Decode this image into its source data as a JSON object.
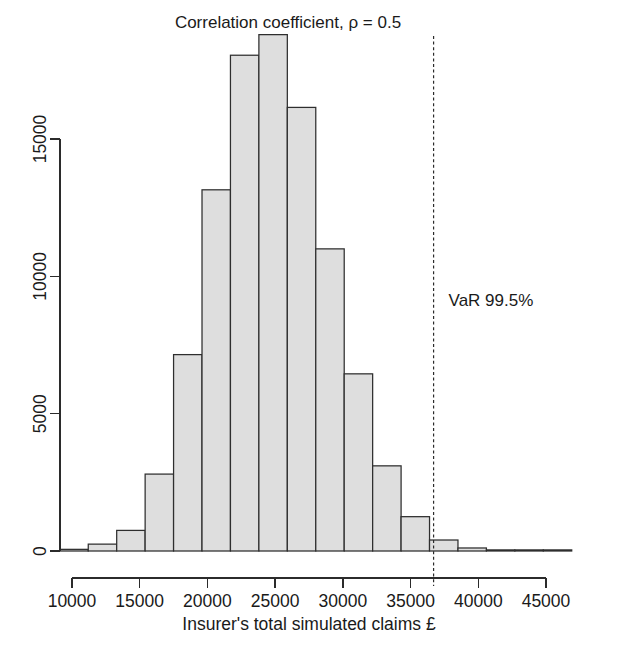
{
  "chart_data": {
    "type": "bar",
    "subtype": "histogram",
    "title": "Correlation coefficient, ρ = 0.5",
    "xlabel": "Insurer's total simulated claims £",
    "ylabel": "",
    "xlim": [
      9000,
      46500
    ],
    "ylim": [
      0,
      19500
    ],
    "xticks": [
      10000,
      15000,
      20000,
      25000,
      30000,
      35000,
      40000,
      45000
    ],
    "xticklabels": [
      "10000",
      "15000",
      "20000",
      "25000",
      "30000",
      "35000",
      "40000",
      "45000"
    ],
    "yticks": [
      0,
      5000,
      10000,
      15000
    ],
    "yticklabels": [
      "0",
      "5000",
      "10000",
      "15000"
    ],
    "grid": false,
    "legend": false,
    "bin_width": 2100,
    "bin_edges": [
      9100,
      11200,
      13300,
      15400,
      17500,
      19600,
      21700,
      23800,
      25900,
      28000,
      30100,
      32200,
      34300,
      36400,
      38500,
      40600,
      42700,
      44800,
      46900
    ],
    "bin_centers": [
      10150,
      12250,
      14350,
      16450,
      18550,
      20650,
      22750,
      24850,
      26950,
      29050,
      31150,
      33250,
      35350,
      37450,
      39550,
      41650,
      43750,
      45850
    ],
    "values": [
      60,
      250,
      750,
      2800,
      7150,
      13150,
      18050,
      18800,
      16150,
      11000,
      6450,
      3100,
      1250,
      400,
      110,
      40,
      10,
      0
    ],
    "annotations": [
      {
        "name": "var-line",
        "label": "VaR 99.5%",
        "x": 36700,
        "style": "vertical dashed line",
        "label_x": 38000,
        "label_y": 7000
      }
    ],
    "bar_fill_color": "#dedede",
    "bar_edge_color": "#2e2e2e",
    "axis_color": "#2b2b2b"
  },
  "figure": {
    "background_color": "#ffffff",
    "title_text": "Correlation coefficient, ρ = 0.5",
    "xaxis_title": "Insurer's total simulated claims £"
  }
}
